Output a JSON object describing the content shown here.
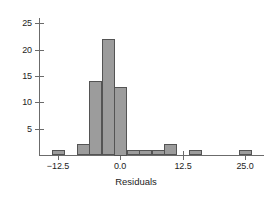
{
  "chart_data": {
    "type": "bar",
    "title": "",
    "subtitle": "",
    "xlabel": "Residuals",
    "ylabel": "",
    "grid": false,
    "legend": null,
    "xlim": [
      -16.25,
      28.75
    ],
    "ylim": [
      0,
      26
    ],
    "xticks": [
      -12.5,
      0.0,
      12.5,
      25.0
    ],
    "xtick_labels": [
      "−12.5",
      "0.0",
      "12.5",
      "25.0"
    ],
    "yticks": [
      5,
      10,
      15,
      20,
      25
    ],
    "ytick_labels": [
      "5",
      "10",
      "15",
      "20",
      "25"
    ],
    "bin_width": 2.5,
    "bar_fill": "#9c9c9c",
    "bar_stroke": "#545454",
    "axis_color": "#6b6b6b",
    "text_color": "#1d1d1d",
    "background": "#ffffff",
    "bins": [
      {
        "left": -13.75,
        "right": -11.25,
        "center": -12.5,
        "count": 1
      },
      {
        "left": -8.75,
        "right": -6.25,
        "center": -7.5,
        "count": 2
      },
      {
        "left": -6.25,
        "right": -3.75,
        "center": -5.0,
        "count": 14
      },
      {
        "left": -3.75,
        "right": -1.25,
        "center": -2.5,
        "count": 22
      },
      {
        "left": -1.25,
        "right": 1.25,
        "center": 0.0,
        "count": 13
      },
      {
        "left": 1.25,
        "right": 3.75,
        "center": 2.5,
        "count": 1
      },
      {
        "left": 3.75,
        "right": 6.25,
        "center": 5.0,
        "count": 1
      },
      {
        "left": 6.25,
        "right": 8.75,
        "center": 7.5,
        "count": 1
      },
      {
        "left": 8.75,
        "right": 11.25,
        "center": 10.0,
        "count": 2
      },
      {
        "left": 13.75,
        "right": 16.25,
        "center": 15.0,
        "count": 1
      },
      {
        "left": 23.75,
        "right": 26.25,
        "center": 25.0,
        "count": 1
      }
    ],
    "categories": [
      -12.5,
      -7.5,
      -5.0,
      -2.5,
      0.0,
      2.5,
      5.0,
      7.5,
      10.0,
      15.0,
      25.0
    ],
    "values": [
      1,
      2,
      14,
      22,
      13,
      1,
      1,
      1,
      2,
      1,
      1
    ]
  }
}
